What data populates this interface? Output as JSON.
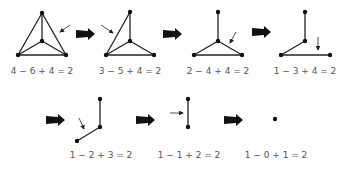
{
  "diagram": {
    "title": "",
    "stages": [
      {
        "id": "s1",
        "equation": "4 − 6 + 4 = 2",
        "vertices": 4,
        "edges": 6,
        "faces": 4
      },
      {
        "id": "s2",
        "equation": "3 − 5 + 4 = 2",
        "vertices": 3,
        "edges": 5,
        "faces": 4
      },
      {
        "id": "s3",
        "equation": "2 − 4 + 4 = 2",
        "vertices": 2,
        "edges": 4,
        "faces": 4
      },
      {
        "id": "s4",
        "equation": "1 − 3 + 4 = 2",
        "vertices": 1,
        "edges": 3,
        "faces": 4
      },
      {
        "id": "s5",
        "equation": "1 − 2 + 3 = 2",
        "vertices": 1,
        "edges": 2,
        "faces": 3
      },
      {
        "id": "s6",
        "equation": "1 − 1 + 2 = 2",
        "vertices": 1,
        "edges": 1,
        "faces": 2
      },
      {
        "id": "s7",
        "equation": "1 − 0 + 1 = 2",
        "vertices": 1,
        "edges": 0,
        "faces": 1
      }
    ],
    "colors": {
      "line": "#222222",
      "text": "#555555",
      "background": "#ffffff"
    }
  }
}
